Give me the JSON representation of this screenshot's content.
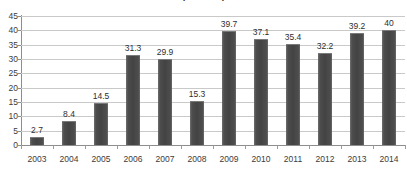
{
  "chart_data": {
    "type": "bar",
    "title": "($ Billion)",
    "xlabel": "",
    "ylabel": "",
    "categories": [
      "2003",
      "2004",
      "2005",
      "2006",
      "2007",
      "2008",
      "2009",
      "2010",
      "2011",
      "2012",
      "2013",
      "2014"
    ],
    "values": [
      2.7,
      8.4,
      14.5,
      31.3,
      29.9,
      15.3,
      39.7,
      37.1,
      35.4,
      32.2,
      39.2,
      40
    ],
    "data_labels": [
      "2.7",
      "8.4",
      "14.5",
      "31.3",
      "29.9",
      "15.3",
      "39.7",
      "37.1",
      "35.4",
      "32.2",
      "39.2",
      "40"
    ],
    "ylim": [
      0,
      45
    ],
    "ytick_values": [
      0,
      5,
      10,
      15,
      20,
      25,
      30,
      35,
      40,
      45
    ],
    "ytick_labels": [
      "0",
      "5",
      "10",
      "15",
      "20",
      "25",
      "30",
      "35",
      "40",
      "45"
    ],
    "grid": true,
    "grid_axis": "y",
    "legend": false,
    "legend_position": "none",
    "colors": {
      "bar_fill": "#434343",
      "bar_edge": "#6f6f6f",
      "gridline": "#c9c9c9",
      "axis_line": "#8d8d8d",
      "text": "#3b3b3b",
      "background": "#ffffff"
    }
  }
}
